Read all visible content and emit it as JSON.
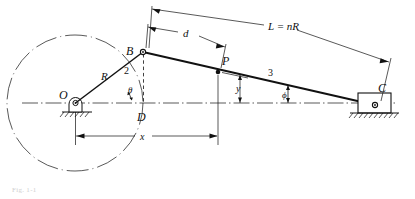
{
  "figure": {
    "type": "offset-slider-crank-kinematic-diagram",
    "caption": "Fig. 1-1",
    "background_color": "#ffffff",
    "line_color": "#111111"
  },
  "points": {
    "O": {
      "label": "O",
      "x": 75,
      "y": 103,
      "role": "crank-pivot-center"
    },
    "B": {
      "label": "B",
      "x": 143,
      "y": 52,
      "role": "crank-pin-joint"
    },
    "D": {
      "label": "D",
      "x": 143,
      "y": 103,
      "role": "foot-of-perpendicular"
    },
    "P": {
      "label": "P",
      "x": 218,
      "y": 72,
      "role": "coupler-point"
    },
    "C": {
      "label": "C",
      "x": 375,
      "y": 105,
      "role": "slider-pin"
    }
  },
  "links": {
    "crank": {
      "label": "2",
      "from": "O",
      "to": "B"
    },
    "coupler": {
      "label": "3",
      "from": "B",
      "to": "C"
    }
  },
  "dimensions": {
    "radius": {
      "label": "R",
      "description": "crank radius O to B"
    },
    "length": {
      "label": "L = nR",
      "description": "coupler length B to C"
    },
    "offset_d": {
      "label": "d",
      "description": "distance B to P along coupler"
    },
    "height_y": {
      "label": "y",
      "description": "vertical height of P above centerline"
    },
    "horizontal_x": {
      "label": "x",
      "description": "horizontal distance from O to P"
    }
  },
  "angles": {
    "theta": {
      "label": "θ",
      "description": "crank angle from centerline"
    },
    "phi": {
      "label": "ϕ",
      "description": "coupler angle from centerline"
    }
  },
  "elements": {
    "crank_circle": "dashed-circle-path-of-B",
    "centerline": "horizontal-dash-dot-centerline-through-O-and-C",
    "ground_left": "hatched-ground-under-pivot-O",
    "ground_right": "hatched-ground-under-slider-C",
    "slider_block": "rectangular-slider-at-C",
    "vertical_BD": "dashed-vertical-from-B-to-D"
  }
}
